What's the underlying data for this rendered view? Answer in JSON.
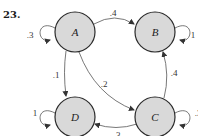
{
  "problem": {
    "number": "23."
  },
  "colors": {
    "node_fill": "#d9d9d9",
    "node_stroke": "#2a2a2a",
    "edge": "#555555"
  },
  "nodes": [
    {
      "id": "A",
      "label": "A"
    },
    {
      "id": "B",
      "label": "B"
    },
    {
      "id": "C",
      "label": "C"
    },
    {
      "id": "D",
      "label": "D"
    }
  ],
  "edges": {
    "A_A": {
      "from": "A",
      "to": "A",
      "label": ".3"
    },
    "A_B": {
      "from": "A",
      "to": "B",
      "label": ".4"
    },
    "A_C": {
      "from": "A",
      "to": "C",
      "label": ".2"
    },
    "A_D": {
      "from": "A",
      "to": "D",
      "label": ".1"
    },
    "B_B": {
      "from": "B",
      "to": "B",
      "label": "1"
    },
    "C_B": {
      "from": "C",
      "to": "B",
      "label": ".4"
    },
    "C_C": {
      "from": "C",
      "to": "C",
      "label": ".3"
    },
    "C_D": {
      "from": "C",
      "to": "D",
      "label": ".3"
    },
    "D_D": {
      "from": "D",
      "to": "D",
      "label": "1"
    }
  }
}
